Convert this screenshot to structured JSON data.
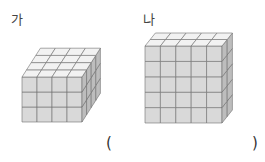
{
  "figures": [
    {
      "label": "가",
      "cubes": {
        "width": 4,
        "depth": 4,
        "height": 3
      }
    },
    {
      "label": "나",
      "cubes": {
        "width": 5,
        "depth": 2,
        "height": 5
      }
    }
  ],
  "answer": {
    "open": "(",
    "close": ")",
    "value": ""
  },
  "colors": {
    "front": "#d9d9d9",
    "top": "#f2f2f2",
    "side": "#bdbdbd",
    "line": "#6e6e6e"
  }
}
